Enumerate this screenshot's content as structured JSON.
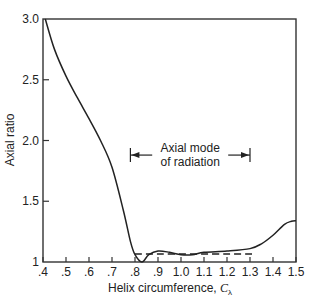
{
  "chart_data": {
    "type": "line",
    "title": "",
    "xlabel": "Helix circumference, Cλ",
    "xlabel_main": "Helix circumference, ",
    "xlabel_symbol": "C",
    "xlabel_subscript": "λ",
    "ylabel": "Axial ratio",
    "xlim": [
      0.4,
      1.5
    ],
    "ylim": [
      1.0,
      3.0
    ],
    "x_ticks": [
      ".4",
      ".5",
      ".6",
      ".7",
      ".8",
      ".9",
      "1.0",
      "1.1",
      "1.2",
      "1.3",
      "1.4",
      "1.5"
    ],
    "y_ticks": [
      "1",
      "1.5",
      "2.0",
      "2.5",
      "3.0"
    ],
    "grid": false,
    "series": [
      {
        "name": "Measured axial ratio",
        "style": "solid",
        "x": [
          0.41,
          0.45,
          0.5,
          0.55,
          0.6,
          0.65,
          0.7,
          0.75,
          0.78,
          0.8,
          0.83,
          0.86,
          0.9,
          0.95,
          1.0,
          1.05,
          1.1,
          1.2,
          1.3,
          1.35,
          1.4,
          1.45,
          1.48,
          1.5
        ],
        "values": [
          3.0,
          2.75,
          2.53,
          2.35,
          2.18,
          2.0,
          1.78,
          1.42,
          1.17,
          1.06,
          1.0,
          1.06,
          1.09,
          1.08,
          1.06,
          1.06,
          1.08,
          1.09,
          1.11,
          1.15,
          1.22,
          1.31,
          1.335,
          1.34
        ]
      },
      {
        "name": "Calculated (dashed)",
        "style": "dashed",
        "x": [
          0.8,
          1.31
        ],
        "values": [
          1.065,
          1.065
        ]
      }
    ],
    "annotations": [
      {
        "text_line1": "Axial mode",
        "text_line2": "of radiation",
        "type": "range-arrow",
        "x_start": 0.78,
        "x_end": 1.3,
        "y": 1.88
      }
    ]
  }
}
